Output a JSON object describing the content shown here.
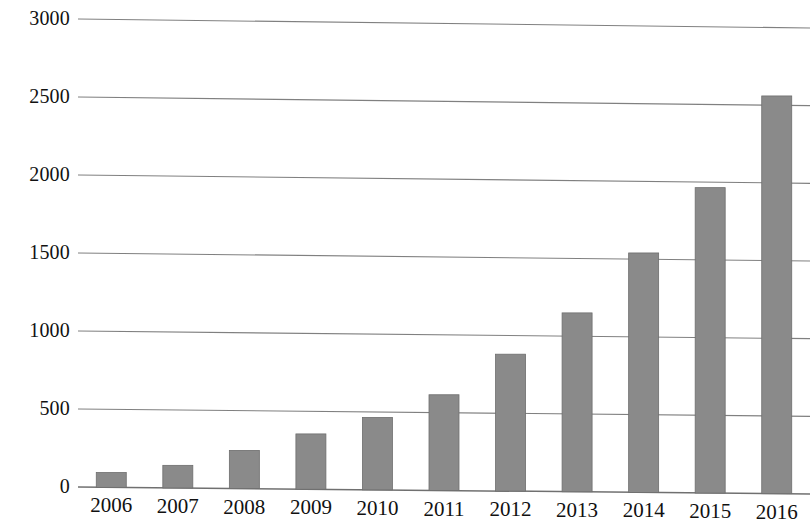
{
  "chart_data": {
    "type": "bar",
    "title": "",
    "subtitle": "",
    "xlabel": "",
    "ylabel": "",
    "categories": [
      "2006",
      "2007",
      "2008",
      "2009",
      "2010",
      "2011",
      "2012",
      "2013",
      "2014",
      "2015",
      "2016"
    ],
    "values": [
      95,
      145,
      245,
      355,
      465,
      615,
      880,
      1150,
      1540,
      1965,
      2560
    ],
    "series": [
      {
        "name": "",
        "values": [
          95,
          145,
          245,
          355,
          465,
          615,
          880,
          1150,
          1540,
          1965,
          2560
        ]
      }
    ],
    "ylim": [
      0,
      3000
    ],
    "ytick_labels": [
      "0",
      "500",
      "1000",
      "1500",
      "2000",
      "2500",
      "3000"
    ],
    "ytick_values": [
      0,
      500,
      1000,
      1500,
      2000,
      2500,
      3000
    ],
    "grid": true,
    "grid_axis": "y",
    "legend": false,
    "legend_position": "none",
    "bar_color": "#8a8a8a",
    "bar_edge_color": "#6e6e6e",
    "grid_color": "#808080",
    "axis_color": "#707070",
    "background_color": "#ffffff",
    "annotations": []
  },
  "axis": {
    "y_labels": [
      {
        "text": "3000",
        "value": 3000
      },
      {
        "text": "2500",
        "value": 2500
      },
      {
        "text": "2000",
        "value": 2000
      },
      {
        "text": "1500",
        "value": 1500
      },
      {
        "text": "1000",
        "value": 1000
      },
      {
        "text": "500",
        "value": 500
      },
      {
        "text": "0",
        "value": 0
      }
    ],
    "x_labels": [
      {
        "text": "2006"
      },
      {
        "text": "2007"
      },
      {
        "text": "2008"
      },
      {
        "text": "2009"
      },
      {
        "text": "2010"
      },
      {
        "text": "2011"
      },
      {
        "text": "2012"
      },
      {
        "text": "2013"
      },
      {
        "text": "2014"
      },
      {
        "text": "2015"
      },
      {
        "text": "2016"
      }
    ]
  }
}
